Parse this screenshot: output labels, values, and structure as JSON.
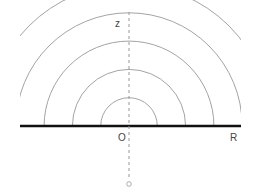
{
  "diagram": {
    "labels": {
      "z_axis": "z",
      "origin": "O",
      "radius": "R"
    },
    "arc_count": 5,
    "colors": {
      "arc": "#999999",
      "baseline": "#111111",
      "axis": "#999999",
      "text": "#444444"
    }
  }
}
